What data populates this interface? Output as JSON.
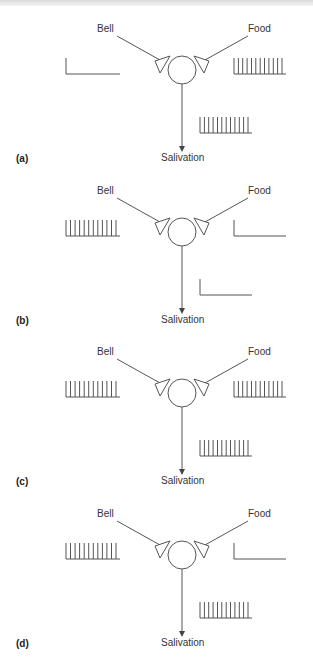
{
  "figure": {
    "title": "",
    "panels": [
      {
        "id": "a",
        "letter": "(a)",
        "inputs": {
          "bell": {
            "label": "Bell",
            "activity": "none"
          },
          "food": {
            "label": "Food",
            "activity": "spikes"
          }
        },
        "output": {
          "label": "Salivation",
          "activity": "spikes"
        }
      },
      {
        "id": "b",
        "letter": "(b)",
        "inputs": {
          "bell": {
            "label": "Bell",
            "activity": "spikes"
          },
          "food": {
            "label": "Food",
            "activity": "none"
          }
        },
        "output": {
          "label": "Salivation",
          "activity": "none"
        }
      },
      {
        "id": "c",
        "letter": "(c)",
        "inputs": {
          "bell": {
            "label": "Bell",
            "activity": "spikes"
          },
          "food": {
            "label": "Food",
            "activity": "spikes"
          }
        },
        "output": {
          "label": "Salivation",
          "activity": "spikes"
        }
      },
      {
        "id": "d",
        "letter": "(d)",
        "inputs": {
          "bell": {
            "label": "Bell",
            "activity": "spikes"
          },
          "food": {
            "label": "Food",
            "activity": "none"
          }
        },
        "output": {
          "label": "Salivation",
          "activity": "spikes"
        }
      }
    ],
    "spike_count": 12,
    "colors": {
      "stroke": "#555555",
      "text": "#333333",
      "background": "#ffffff"
    }
  }
}
